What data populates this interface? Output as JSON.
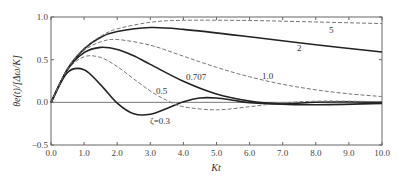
{
  "chart_data": {
    "type": "line",
    "title": "",
    "xlabel": "Kt",
    "ylabel": "θe(t)/[Δω/K]",
    "xlim": [
      0.0,
      10.0
    ],
    "ylim": [
      -0.5,
      1.0
    ],
    "xticks": [
      "0.0",
      "1.0",
      "2.0",
      "3.0",
      "4.0",
      "5.0",
      "6.0",
      "7.0",
      "8.0",
      "9.0",
      "10.0"
    ],
    "yticks": [
      "-0.5",
      "0.0",
      "0.5",
      "1.0"
    ],
    "grid": false,
    "legend": "inline labels",
    "series": [
      {
        "name": "ζ=0.3",
        "label": "ζ=0.3",
        "style": "solid",
        "x": [
          0,
          0.5,
          1,
          1.5,
          2,
          2.5,
          3,
          3.5,
          4,
          4.5,
          5,
          5.5,
          6,
          7,
          8,
          9,
          10
        ],
        "y": [
          0,
          0.35,
          0.382,
          0.204,
          -0.009,
          -0.134,
          -0.14,
          -0.072,
          0.006,
          0.051,
          0.051,
          0.025,
          -0.004,
          -0.019,
          0.002,
          0.007,
          -0.001
        ],
        "label_pos": [
          150,
          124
        ]
      },
      {
        "name": "ζ=0.5",
        "label": "0.5",
        "style": "dashed",
        "x": [
          0,
          0.5,
          1,
          1.5,
          2,
          2.5,
          3,
          3.5,
          4,
          5,
          6,
          7,
          8,
          9,
          10
        ],
        "y": [
          0,
          0.378,
          0.534,
          0.525,
          0.419,
          0.274,
          0.133,
          0.023,
          -0.052,
          -0.088,
          -0.051,
          -0.007,
          0.013,
          0.013,
          0.006
        ],
        "label_pos": [
          156,
          94
        ]
      },
      {
        "name": "ζ=0.707",
        "label": "0.707",
        "style": "solid",
        "x": [
          0,
          0.5,
          1,
          1.5,
          2,
          2.5,
          3,
          4,
          5,
          6,
          7,
          8,
          10
        ],
        "y": [
          0,
          0.385,
          0.582,
          0.644,
          0.619,
          0.545,
          0.445,
          0.246,
          0.098,
          0.014,
          -0.021,
          -0.028,
          -0.013
        ],
        "label_pos": [
          186,
          80
        ]
      },
      {
        "name": "ζ=1.0",
        "label": "1.0",
        "style": "dashed",
        "x": [
          0,
          0.5,
          1,
          1.5,
          2,
          3,
          4,
          5,
          6,
          7,
          8,
          9,
          10
        ],
        "y": [
          0,
          0.389,
          0.607,
          0.708,
          0.736,
          0.669,
          0.541,
          0.41,
          0.299,
          0.211,
          0.147,
          0.1,
          0.067
        ],
        "label_pos": [
          262,
          79
        ]
      },
      {
        "name": "ζ=2",
        "label": "2",
        "style": "solid",
        "x": [
          0,
          0.5,
          1,
          1.5,
          2,
          3,
          4,
          6,
          8,
          10
        ],
        "y": [
          0,
          0.392,
          0.626,
          0.763,
          0.83,
          0.877,
          0.855,
          0.768,
          0.674,
          0.59
        ],
        "label_pos": [
          297,
          51
        ]
      },
      {
        "name": "ζ=5",
        "label": "5",
        "style": "dashed",
        "x": [
          0,
          0.5,
          1,
          1.5,
          2,
          3,
          4,
          6,
          8,
          10
        ],
        "y": [
          0,
          0.393,
          0.631,
          0.774,
          0.86,
          0.938,
          0.961,
          0.959,
          0.941,
          0.923
        ],
        "label_pos": [
          329,
          33
        ]
      }
    ]
  }
}
